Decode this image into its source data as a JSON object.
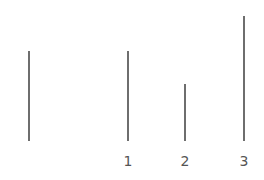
{
  "diagram": {
    "line_color": "#6e6e6e",
    "label_color": "#555555",
    "reference_line": {
      "relative_length": 90,
      "label": ""
    },
    "comparison_lines": [
      {
        "label": "1",
        "relative_length": 90
      },
      {
        "label": "2",
        "relative_length": 57
      },
      {
        "label": "3",
        "relative_length": 125
      }
    ]
  }
}
